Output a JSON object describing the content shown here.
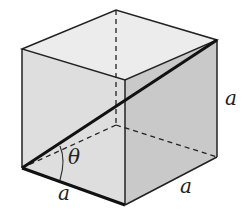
{
  "diagram": {
    "type": "cube-with-diagonal",
    "colors": {
      "top_face": "#ececec",
      "front_face": "#dedede",
      "right_face": "#c9c9c9",
      "edge": "#222222"
    },
    "labels": {
      "edge_bottom_front": "a",
      "edge_bottom_right": "a",
      "edge_vertical_right": "a",
      "angle": "θ"
    }
  }
}
